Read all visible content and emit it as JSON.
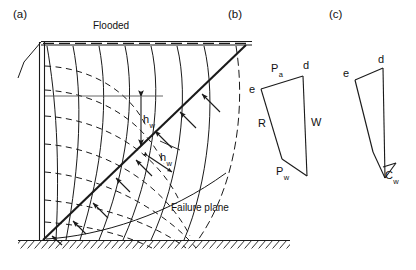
{
  "figure": {
    "background_color": "#ffffff",
    "line_color": "#1a1a1a",
    "panels": [
      {
        "id": "a",
        "tag": "(a)",
        "caption": "Flow net and failure plane behind flooded wall"
      },
      {
        "id": "b",
        "tag": "(b)",
        "caption": "Force polygon with water thrust"
      },
      {
        "id": "c",
        "tag": "(c)",
        "caption": "Force polygon with wall adhesion"
      }
    ]
  },
  "panel_a": {
    "tag": "(a)",
    "water_surface_label": "Flooded",
    "failure_plane_label": "Failure plane",
    "head_label_upper": "h",
    "head_label_upper_sub": "w",
    "head_label_lower": "h",
    "head_label_lower_sub": "w",
    "elements": {
      "wall": "vertical-double-line-retaining-wall",
      "ground": "hatched-base",
      "equipotential_lines": "solid-curves",
      "flow_lines": "dashed-curves",
      "seepage_arrows": "arrows-normal-to-failure-plane",
      "phreatic_reference_line": "horizontal-thin-line"
    }
  },
  "panel_b": {
    "tag": "(b)",
    "vertices": {
      "e": "e",
      "d": "d"
    },
    "forces": [
      {
        "symbol": "P",
        "subscript": "a",
        "name": "active-earth-pressure"
      },
      {
        "symbol": "W",
        "subscript": "",
        "name": "weight"
      },
      {
        "symbol": "R",
        "subscript": "",
        "name": "reaction"
      },
      {
        "symbol": "P",
        "subscript": "w",
        "name": "water-pressure"
      }
    ]
  },
  "panel_c": {
    "tag": "(c)",
    "vertices": {
      "e": "e",
      "d": "d"
    },
    "forces": [
      {
        "symbol": "C",
        "subscript": "w",
        "name": "wall-adhesion"
      }
    ]
  }
}
